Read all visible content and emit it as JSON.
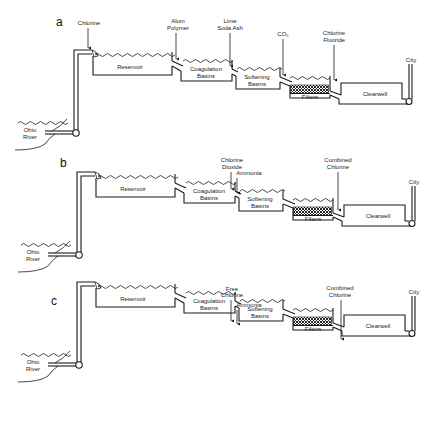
{
  "figure": {
    "panels": [
      {
        "id": "a",
        "source": "Ohio River",
        "units": [
          "Reservoir",
          "Coagulation Basins",
          "Softening Basins",
          "Filters",
          "Clearwell"
        ],
        "destination": "City",
        "chemical_additions": [
          {
            "label": "Chlorine",
            "lines": [
              "Chlorine"
            ],
            "point": "intake to reservoir"
          },
          {
            "label": "Alum Polymer",
            "lines": [
              "Alum",
              "Polymer"
            ],
            "point": "reservoir to coagulation"
          },
          {
            "label": "Lime Soda Ash",
            "lines": [
              "Lime",
              "Soda Ash"
            ],
            "point": "coagulation to softening"
          },
          {
            "label": "CO2",
            "lines": [
              "CO₂"
            ],
            "point": "softening to filters"
          },
          {
            "label": "Chlorine Fluoride",
            "lines": [
              "Chlorine",
              "Fluoride"
            ],
            "point": "filters to clearwell"
          }
        ]
      },
      {
        "id": "b",
        "source": "Ohio River",
        "units": [
          "Reservoir",
          "Coagulation Basins",
          "Softening Basins",
          "Filters",
          "Clearwell"
        ],
        "destination": "City",
        "chemical_additions": [
          {
            "label": "Chlorine Dioxide",
            "lines": [
              "Chlorine",
              "Dioxide"
            ],
            "point": "coagulation to softening"
          },
          {
            "label": "Ammonia",
            "lines": [
              "Ammonia"
            ],
            "point": "softening basin inlet"
          },
          {
            "label": "Combined Chlorine",
            "lines": [
              "Combined",
              "Chlorine"
            ],
            "point": "filters to clearwell"
          }
        ]
      },
      {
        "id": "c",
        "source": "Ohio River",
        "units": [
          "Reservoir",
          "Coagulation Basins",
          "Softening Basins",
          "Filters",
          "Clearwell"
        ],
        "destination": "City",
        "chemical_additions": [
          {
            "label": "Free Chlorine",
            "lines": [
              "Free",
              "Chlorine"
            ],
            "point": "coagulation to softening"
          },
          {
            "label": "Ammonia",
            "lines": [
              "Ammonia"
            ],
            "point": "softening basin inlet"
          },
          {
            "label": "Combined Chlorine",
            "lines": [
              "Combined",
              "Chlorine"
            ],
            "point": "filters to clearwell"
          }
        ]
      }
    ]
  },
  "labels": {
    "a": "a",
    "b": "b",
    "c": "c",
    "reservoir": "Reservoir",
    "coag1": "Coagulation",
    "coag2": "Basins",
    "soft1": "Softening",
    "soft2": "Basins",
    "filters": "Filters",
    "clearwell": "Clearwell",
    "city": "City",
    "river1": "Ohio",
    "river2": "River",
    "a_chem": {
      "chlorine": "Chlorine",
      "alum": "Alum",
      "polymer": "Polymer",
      "lime": "Lime",
      "soda": "Soda Ash",
      "co2": "CO₂",
      "chl": "Chlorine",
      "fluoride": "Fluoride"
    },
    "b_chem": {
      "cd1": "Chlorine",
      "cd2": "Dioxide",
      "ammonia": "Ammonia",
      "cc1": "Combined",
      "cc2": "Chlorine"
    },
    "c_chem": {
      "fc1": "Free",
      "fc2": "Chlorine",
      "ammonia": "Ammonia",
      "cc1": "Combined",
      "cc2": "Chlorine"
    }
  }
}
